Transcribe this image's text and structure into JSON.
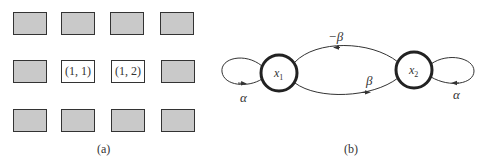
{
  "panel_a": {
    "caption": "(a)",
    "grid": [
      [
        {
          "label": "",
          "highlighted": false
        },
        {
          "label": "",
          "highlighted": false
        },
        {
          "label": "",
          "highlighted": false
        },
        {
          "label": "",
          "highlighted": false
        }
      ],
      [
        {
          "label": "",
          "highlighted": false
        },
        {
          "label": "(1, 1)",
          "highlighted": true
        },
        {
          "label": "(1, 2)",
          "highlighted": true
        },
        {
          "label": "",
          "highlighted": false
        }
      ],
      [
        {
          "label": "",
          "highlighted": false
        },
        {
          "label": "",
          "highlighted": false
        },
        {
          "label": "",
          "highlighted": false
        },
        {
          "label": "",
          "highlighted": false
        }
      ]
    ],
    "fill_color": "#c9c9c9"
  },
  "panel_b": {
    "caption": "(b)",
    "nodes": [
      {
        "id": "x1",
        "label": "x",
        "sub": "1"
      },
      {
        "id": "x2",
        "label": "x",
        "sub": "2"
      }
    ],
    "edges": [
      {
        "from": "x1",
        "to": "x1",
        "label": "α"
      },
      {
        "from": "x2",
        "to": "x1",
        "label": "−β"
      },
      {
        "from": "x1",
        "to": "x2",
        "label": "β"
      },
      {
        "from": "x2",
        "to": "x2",
        "label": "α"
      }
    ]
  }
}
